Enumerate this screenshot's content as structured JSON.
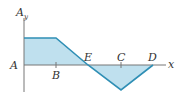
{
  "diagram": {
    "type": "shear-force-diagram",
    "y_axis_label": "A",
    "y_axis_subscript": "y",
    "x_axis_label": "x",
    "points": {
      "A": "A",
      "B": "B",
      "E": "E",
      "C": "C",
      "D": "D"
    },
    "colors": {
      "fill": "#bfe0ee",
      "outline": "#2f8fb5",
      "axis": "#777777",
      "text": "#333333"
    }
  }
}
